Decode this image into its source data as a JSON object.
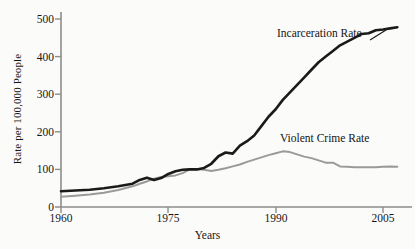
{
  "chart_data": {
    "type": "line",
    "title": "",
    "xlabel": "Years",
    "ylabel": "Rate per 100,000 People",
    "xlim": [
      1960,
      2007
    ],
    "ylim": [
      0,
      520
    ],
    "grid": false,
    "legend_position": "inline-annotation",
    "xticks": [
      1960,
      1975,
      1990,
      2005
    ],
    "xtick_labels": [
      "1960",
      "1975",
      "1990",
      "2005"
    ],
    "yticks": [
      0,
      100,
      200,
      300,
      400,
      500
    ],
    "ytick_labels": [
      "0",
      "100",
      "200",
      "300",
      "400",
      "500"
    ],
    "series": [
      {
        "name": "Incarceration Rate",
        "color": "#1a1a1a",
        "width": 2.6,
        "x": [
          1960,
          1962,
          1964,
          1966,
          1968,
          1970,
          1971,
          1972,
          1973,
          1974,
          1975,
          1976,
          1977,
          1978,
          1979,
          1980,
          1981,
          1982,
          1983,
          1984,
          1985,
          1986,
          1987,
          1988,
          1989,
          1990,
          1991,
          1992,
          1993,
          1994,
          1995,
          1996,
          1997,
          1998,
          1999,
          2000,
          2001,
          2002,
          2003,
          2004,
          2005,
          2006,
          2007
        ],
        "values": [
          42,
          44,
          46,
          50,
          55,
          62,
          72,
          78,
          72,
          77,
          88,
          95,
          99,
          100,
          100,
          104,
          115,
          135,
          145,
          142,
          163,
          175,
          190,
          215,
          240,
          260,
          285,
          305,
          325,
          345,
          365,
          385,
          400,
          415,
          430,
          440,
          450,
          460,
          462,
          470,
          472,
          475,
          478
        ]
      },
      {
        "name": "Violent Crime Rate",
        "color": "#9a9a9a",
        "width": 2.0,
        "x": [
          1960,
          1962,
          1964,
          1966,
          1968,
          1970,
          1971,
          1972,
          1973,
          1974,
          1975,
          1976,
          1977,
          1978,
          1979,
          1980,
          1981,
          1982,
          1983,
          1984,
          1985,
          1986,
          1987,
          1988,
          1989,
          1990,
          1991,
          1992,
          1993,
          1994,
          1995,
          1996,
          1997,
          1998,
          1999,
          2000,
          2001,
          2002,
          2003,
          2004,
          2005,
          2006,
          2007
        ],
        "values": [
          27,
          30,
          33,
          38,
          45,
          55,
          62,
          68,
          75,
          80,
          82,
          84,
          90,
          100,
          101,
          99,
          96,
          99,
          103,
          108,
          113,
          120,
          126,
          132,
          138,
          143,
          148,
          146,
          140,
          134,
          130,
          124,
          118,
          118,
          108,
          107,
          106,
          106,
          106,
          106,
          107,
          108,
          107
        ]
      }
    ],
    "annotations": [
      {
        "text": "Incarceration Rate",
        "x": 1990,
        "y": 470
      },
      {
        "text": "Violent Crime Rate",
        "x": 1990,
        "y": 175
      }
    ]
  },
  "axes": {
    "x_axis_label": "Years",
    "y_axis_label": "Rate per 100,000 People",
    "axis_color": "#8d8d8d"
  }
}
